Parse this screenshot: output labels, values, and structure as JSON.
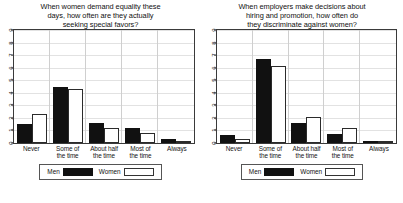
{
  "figure": {
    "panels": [
      {
        "id": "left",
        "title_lines": [
          "When women demand equality these",
          "days, how often are they actually",
          "seeking special favors?"
        ],
        "legend": {
          "men_label": "Men",
          "women_label": "Women"
        },
        "chart_data": {
          "type": "bar",
          "title": "When women demand equality these days, how often are they actually seeking special favors?",
          "xlabel": "",
          "ylabel": "",
          "ylim": [
            0,
            9
          ],
          "yticks": [
            0,
            1,
            2,
            3,
            4,
            5,
            6,
            7,
            8,
            9
          ],
          "grid": true,
          "legend_position": "bottom",
          "categories": [
            "Never",
            "Some of the time",
            "About half the time",
            "Most of the time",
            "Always"
          ],
          "series": [
            {
              "name": "Men",
              "color": "#111111",
              "values": [
                1.5,
                4.5,
                1.6,
                1.2,
                0.3
              ]
            },
            {
              "name": "Women",
              "color": "#ffffff",
              "values": [
                2.3,
                4.3,
                1.2,
                0.8,
                0.1
              ]
            }
          ]
        }
      },
      {
        "id": "right",
        "title_lines": [
          "When employers make decisions about",
          "hiring and promotion, how often do",
          "they discriminate against women?"
        ],
        "legend": {
          "men_label": "Men",
          "women_label": "Women"
        },
        "chart_data": {
          "type": "bar",
          "title": "When employers make decisions about hiring and promotion, how often do they discriminate against women?",
          "xlabel": "",
          "ylabel": "",
          "ylim": [
            0,
            9
          ],
          "yticks": [
            0,
            1,
            2,
            3,
            4,
            5,
            6,
            7,
            8,
            9
          ],
          "grid": true,
          "legend_position": "bottom",
          "categories": [
            "Never",
            "Some of the time",
            "About half the time",
            "Most of the time",
            "Always"
          ],
          "series": [
            {
              "name": "Men",
              "color": "#111111",
              "values": [
                0.6,
                6.7,
                1.6,
                0.7,
                0.1
              ]
            },
            {
              "name": "Women",
              "color": "#ffffff",
              "values": [
                0.3,
                6.1,
                2.1,
                1.2,
                0.2
              ]
            }
          ]
        }
      }
    ],
    "category_label_lines": [
      [
        "Never",
        ""
      ],
      [
        "Some of",
        "the time"
      ],
      [
        "About half",
        "the time"
      ],
      [
        "Most of",
        "the time"
      ],
      [
        "Always",
        ""
      ]
    ]
  }
}
